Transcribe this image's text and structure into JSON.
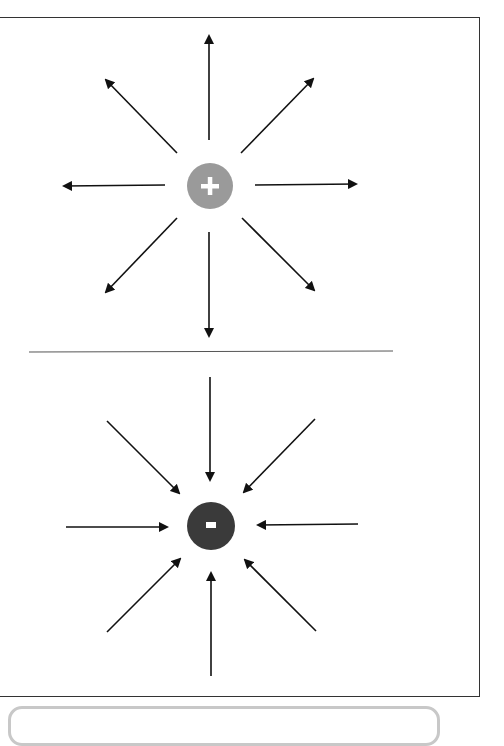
{
  "header": {
    "partial_text": ""
  },
  "diagram": {
    "positive_charge": {
      "symbol": "+",
      "color": "#9a9a9a",
      "field_direction": "outward"
    },
    "negative_charge": {
      "symbol": "-",
      "color": "#3a3a3a",
      "field_direction": "inward"
    },
    "arrow_color": "#111111",
    "divider_color": "#555555"
  }
}
